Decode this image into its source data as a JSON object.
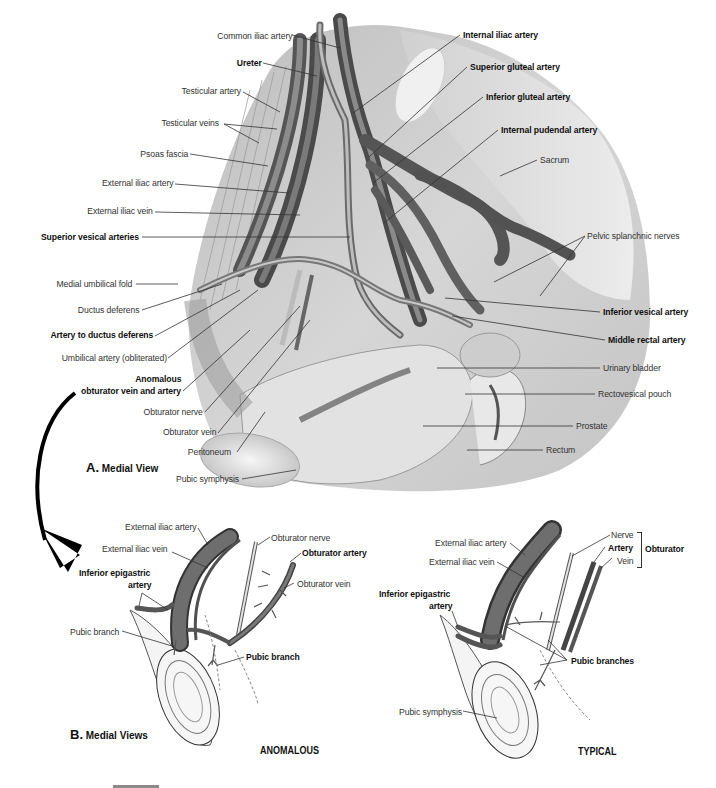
{
  "figure": {
    "panel_a": {
      "title_letter": "A.",
      "title_text": "Medial View",
      "labels": {
        "common_iliac_artery": "Common iliac artery",
        "ureter": "Ureter",
        "testicular_artery": "Testicular artery",
        "testicular_veins": "Testicular veins",
        "psoas_fascia": "Psoas fascia",
        "external_iliac_artery": "External iliac artery",
        "external_iliac_vein": "External iliac vein",
        "superior_vesical_arteries": "Superior vesical arteries",
        "medial_umbilical_fold": "Medial umbilical fold",
        "ductus_deferens": "Ductus deferens",
        "artery_to_ductus_deferens": "Artery to ductus deferens",
        "umbilical_artery": "Umbilical artery (obliterated)",
        "anomalous_line1": "Anomalous",
        "anomalous_line2": "obturator vein and artery",
        "obturator_nerve": "Obturator nerve",
        "obturator_vein": "Obturator vein",
        "peritoneum": "Peritoneum",
        "pubic_symphysis": "Pubic symphysis",
        "internal_iliac_artery": "Internal iliac artery",
        "superior_gluteal_artery": "Superior gluteal artery",
        "inferior_gluteal_artery": "Inferior gluteal artery",
        "internal_pudendal_artery": "Internal pudendal artery",
        "sacrum": "Sacrum",
        "pelvic_splanchnic_nerves": "Pelvic splanchnic nerves",
        "inferior_vesical_artery": "Inferior vesical artery",
        "middle_rectal_artery": "Middle rectal artery",
        "urinary_bladder": "Urinary bladder",
        "rectovesical_pouch": "Rectovesical pouch",
        "prostate": "Prostate",
        "rectum": "Rectum"
      },
      "bold_labels": [
        "Ureter",
        "Superior vesical arteries",
        "Artery to ductus deferens",
        "Anomalous obturator vein and artery",
        "Internal iliac artery",
        "Superior gluteal artery",
        "Inferior gluteal artery",
        "Internal pudendal artery",
        "Inferior vesical artery",
        "Middle rectal artery"
      ]
    },
    "panel_b": {
      "title_letter": "B.",
      "title_text": "Medial Views",
      "anomalous": {
        "tag": "ANOMALOUS",
        "labels": {
          "external_iliac_artery": "External iliac artery",
          "external_iliac_vein": "External iliac vein",
          "inferior_epigastric_line1": "Inferior epigastric",
          "inferior_epigastric_line2": "artery",
          "obturator_nerve": "Obturator nerve",
          "obturator_artery": "Obturator artery",
          "obturator_vein": "Obturator vein",
          "pubic_branch_left": "Pubic branch",
          "pubic_branch_right": "Pubic branch"
        }
      },
      "typical": {
        "tag": "TYPICAL",
        "labels": {
          "external_iliac_artery": "External iliac artery",
          "external_iliac_vein": "External iliac vein",
          "inferior_epigastric_line1": "Inferior epigastric",
          "inferior_epigastric_line2": "artery",
          "nerve": "Nerve",
          "artery": "Artery",
          "vein": "Vein",
          "obturator_group": "Obturator",
          "pubic_branches": "Pubic branches",
          "pubic_symphysis": "Pubic symphysis"
        }
      }
    },
    "colors": {
      "vessel_dark": "#4a4a4a",
      "vessel_mid": "#6e6e6e",
      "tissue_light": "#d9d9d9",
      "nerve_pale": "#e8e8e8",
      "arrow": "#000000",
      "background": "#ffffff"
    }
  }
}
